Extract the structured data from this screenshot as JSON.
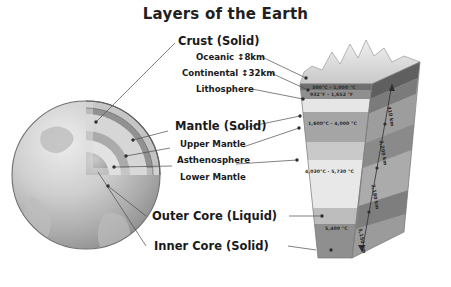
{
  "title": "Layers of the Earth",
  "labels": {
    "crust": "Crust (Solid)",
    "oceanic": "Oceanic ↕8km",
    "continental": "Continental ↕32km",
    "lithosphere": "Lithosphere",
    "mantle": "Mantle (Solid)",
    "upper_mantle": "Upper Mantle",
    "asthenosphere": "Asthenosphere",
    "lower_mantle": "Lower Mantle",
    "outer_core": "Outer Core (Liquid)",
    "inner_core": "Inner Core (Solid)"
  },
  "temperatures": [
    {
      "id": "crust-temp-c",
      "text": "300°C - 1,000 °C"
    },
    {
      "id": "crust-temp-f",
      "text": "932°F - 1,652 °F"
    },
    {
      "id": "mantle-temp",
      "text": "1,600°C - 4,000 °C"
    },
    {
      "id": "outer-core-temp",
      "text": "4,030°C - 5,730 °C"
    },
    {
      "id": "inner-core-temp",
      "text": "5,400 °C"
    }
  ],
  "depths": [
    {
      "id": "depth-410",
      "text": "410 km"
    },
    {
      "id": "depth-2200",
      "text": "2,200 km"
    },
    {
      "id": "depth-2180",
      "text": "2,180 km"
    },
    {
      "id": "depth-5150",
      "text": "5,150 km"
    }
  ],
  "colors": {
    "background": "#ffffff",
    "text": "#231f20",
    "leader_line": "#4a4a4a",
    "crust_dark": "#6e6e6e",
    "lithosphere": "#8d8d8d",
    "upper_mantle": "#d9d9d9",
    "asthenosphere": "#a8a8a8",
    "lower_mantle": "#c4c4c4",
    "outer_core": "#e0e0e0",
    "inner_core": "#9a9a9a",
    "globe_light": "#d2d2d2",
    "globe_mid": "#b0b0b0",
    "globe_dark": "#8a8a8a"
  }
}
